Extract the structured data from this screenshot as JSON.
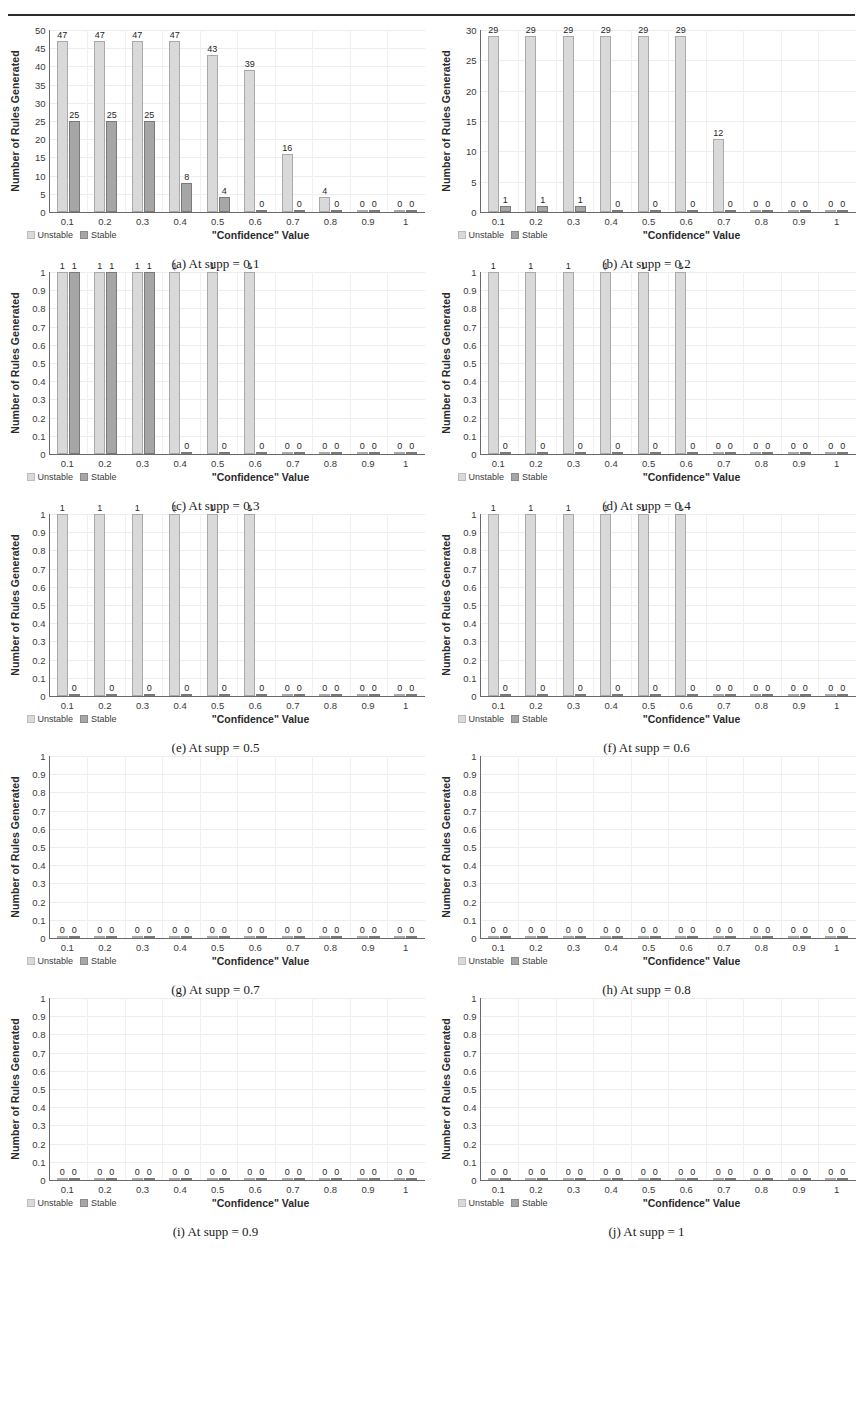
{
  "header": {
    "running_head": ""
  },
  "common": {
    "y_axis_title": "Number of Rules Generated",
    "x_axis_title": "\"Confidence\" Value",
    "legend": [
      {
        "label": "Unstable",
        "color": "#d9d9d9"
      },
      {
        "label": "Stable",
        "color": "#a6a6a6"
      }
    ],
    "categories": [
      "0.1",
      "0.2",
      "0.3",
      "0.4",
      "0.5",
      "0.6",
      "0.7",
      "0.8",
      "0.9",
      "1"
    ],
    "yticks_small": [
      "1",
      "0.9",
      "0.8",
      "0.7",
      "0.6",
      "0.5",
      "0.4",
      "0.3",
      "0.2",
      "0.1",
      "0"
    ],
    "yticks_a": [
      "50",
      "45",
      "40",
      "35",
      "30",
      "25",
      "20",
      "15",
      "10",
      "5",
      "0"
    ],
    "yticks_b": [
      "30",
      "25",
      "20",
      "15",
      "10",
      "5",
      "0"
    ]
  },
  "chart_data": [
    {
      "id": "a",
      "type": "bar",
      "caption": "(a) At supp = 0.1",
      "title": "",
      "xlabel": "\"Confidence\" Value",
      "ylabel": "Number of Rules Generated",
      "ylim": [
        0,
        50
      ],
      "ytick_step": 5,
      "grid": true,
      "legend_position": "bottom-left",
      "categories": [
        "0.1",
        "0.2",
        "0.3",
        "0.4",
        "0.5",
        "0.6",
        "0.7",
        "0.8",
        "0.9",
        "1"
      ],
      "series": [
        {
          "name": "Unstable",
          "values": [
            47,
            47,
            47,
            47,
            43,
            39,
            16,
            4,
            0,
            0
          ]
        },
        {
          "name": "Stable",
          "values": [
            25,
            25,
            25,
            8,
            4,
            0,
            0,
            0,
            0,
            0
          ]
        }
      ],
      "labels": [
        {
          "unstable": "47",
          "stable": "25"
        },
        {
          "unstable": "47",
          "stable": "25"
        },
        {
          "unstable": "47",
          "stable": "25"
        },
        {
          "unstable": "47",
          "stable": "8"
        },
        {
          "unstable": "43",
          "stable": "4"
        },
        {
          "unstable": "39",
          "stable": "0"
        },
        {
          "unstable": "16",
          "stable": "0"
        },
        {
          "unstable": "4",
          "stable": "0"
        },
        {
          "unstable": "0",
          "stable": "0"
        },
        {
          "unstable": "0",
          "stable": "0"
        }
      ]
    },
    {
      "id": "b",
      "type": "bar",
      "caption": "(b) At supp = 0.2",
      "title": "",
      "xlabel": "\"Confidence\" Value",
      "ylabel": "Number of Rules Generated",
      "ylim": [
        0,
        30
      ],
      "ytick_step": 5,
      "grid": true,
      "legend_position": "bottom-left",
      "categories": [
        "0.1",
        "0.2",
        "0.3",
        "0.4",
        "0.5",
        "0.6",
        "0.7",
        "0.8",
        "0.9",
        "1"
      ],
      "series": [
        {
          "name": "Unstable",
          "values": [
            29,
            29,
            29,
            29,
            29,
            29,
            12,
            0,
            0,
            0
          ]
        },
        {
          "name": "Stable",
          "values": [
            1,
            1,
            1,
            0,
            0,
            0,
            0,
            0,
            0,
            0
          ]
        }
      ],
      "labels": [
        {
          "unstable": "29",
          "stable": "1"
        },
        {
          "unstable": "29",
          "stable": "1"
        },
        {
          "unstable": "29",
          "stable": "1"
        },
        {
          "unstable": "29",
          "stable": "0"
        },
        {
          "unstable": "29",
          "stable": "0"
        },
        {
          "unstable": "29",
          "stable": "0"
        },
        {
          "unstable": "12",
          "stable": "0"
        },
        {
          "unstable": "0",
          "stable": "0"
        },
        {
          "unstable": "0",
          "stable": "0"
        },
        {
          "unstable": "0",
          "stable": "0"
        }
      ]
    },
    {
      "id": "c",
      "type": "bar",
      "caption": "(c) At supp = 0.3",
      "title": "",
      "xlabel": "\"Confidence\" Value",
      "ylabel": "Number of Rules Generated",
      "ylim": [
        0,
        1
      ],
      "ytick_step": 0.1,
      "grid": true,
      "legend_position": "bottom-left",
      "categories": [
        "0.1",
        "0.2",
        "0.3",
        "0.4",
        "0.5",
        "0.6",
        "0.7",
        "0.8",
        "0.9",
        "1"
      ],
      "series": [
        {
          "name": "Unstable",
          "values": [
            1,
            1,
            1,
            1,
            1,
            1,
            0,
            0,
            0,
            0
          ]
        },
        {
          "name": "Stable",
          "values": [
            1,
            1,
            1,
            0,
            0,
            0,
            0,
            0,
            0,
            0
          ]
        }
      ],
      "labels": [
        {
          "unstable": "1",
          "stable": "1"
        },
        {
          "unstable": "1",
          "stable": "1"
        },
        {
          "unstable": "1",
          "stable": "1"
        },
        {
          "unstable": "1",
          "stable": "0"
        },
        {
          "unstable": "1",
          "stable": "0"
        },
        {
          "unstable": "1",
          "stable": "0"
        },
        {
          "unstable": "0",
          "stable": "0"
        },
        {
          "unstable": "0",
          "stable": "0"
        },
        {
          "unstable": "0",
          "stable": "0"
        },
        {
          "unstable": "0",
          "stable": "0"
        }
      ]
    },
    {
      "id": "d",
      "type": "bar",
      "caption": "(d) At supp = 0.4",
      "title": "",
      "xlabel": "\"Confidence\" Value",
      "ylabel": "Number of Rules Generated",
      "ylim": [
        0,
        1
      ],
      "ytick_step": 0.1,
      "grid": true,
      "legend_position": "bottom-left",
      "categories": [
        "0.1",
        "0.2",
        "0.3",
        "0.4",
        "0.5",
        "0.6",
        "0.7",
        "0.8",
        "0.9",
        "1"
      ],
      "series": [
        {
          "name": "Unstable",
          "values": [
            1,
            1,
            1,
            1,
            1,
            1,
            0,
            0,
            0,
            0
          ]
        },
        {
          "name": "Stable",
          "values": [
            0,
            0,
            0,
            0,
            0,
            0,
            0,
            0,
            0,
            0
          ]
        }
      ],
      "labels": [
        {
          "unstable": "1",
          "stable": "0"
        },
        {
          "unstable": "1",
          "stable": "0"
        },
        {
          "unstable": "1",
          "stable": "0"
        },
        {
          "unstable": "1",
          "stable": "0"
        },
        {
          "unstable": "1",
          "stable": "0"
        },
        {
          "unstable": "1",
          "stable": "0"
        },
        {
          "unstable": "0",
          "stable": "0"
        },
        {
          "unstable": "0",
          "stable": "0"
        },
        {
          "unstable": "0",
          "stable": "0"
        },
        {
          "unstable": "0",
          "stable": "0"
        }
      ]
    },
    {
      "id": "e",
      "type": "bar",
      "caption": "(e) At supp = 0.5",
      "title": "",
      "xlabel": "\"Confidence\" Value",
      "ylabel": "Number of Rules Generated",
      "ylim": [
        0,
        1
      ],
      "ytick_step": 0.1,
      "grid": true,
      "legend_position": "bottom-left",
      "categories": [
        "0.1",
        "0.2",
        "0.3",
        "0.4",
        "0.5",
        "0.6",
        "0.7",
        "0.8",
        "0.9",
        "1"
      ],
      "series": [
        {
          "name": "Unstable",
          "values": [
            1,
            1,
            1,
            1,
            1,
            1,
            0,
            0,
            0,
            0
          ]
        },
        {
          "name": "Stable",
          "values": [
            0,
            0,
            0,
            0,
            0,
            0,
            0,
            0,
            0,
            0
          ]
        }
      ],
      "labels": [
        {
          "unstable": "1",
          "stable": "0"
        },
        {
          "unstable": "1",
          "stable": "0"
        },
        {
          "unstable": "1",
          "stable": "0"
        },
        {
          "unstable": "1",
          "stable": "0"
        },
        {
          "unstable": "1",
          "stable": "0"
        },
        {
          "unstable": "1",
          "stable": "0"
        },
        {
          "unstable": "0",
          "stable": "0"
        },
        {
          "unstable": "0",
          "stable": "0"
        },
        {
          "unstable": "0",
          "stable": "0"
        },
        {
          "unstable": "0",
          "stable": "0"
        }
      ]
    },
    {
      "id": "f",
      "type": "bar",
      "caption": "(f) At supp = 0.6",
      "title": "",
      "xlabel": "\"Confidence\" Value",
      "ylabel": "Number of Rules Generated",
      "ylim": [
        0,
        1
      ],
      "ytick_step": 0.1,
      "grid": true,
      "legend_position": "bottom-left",
      "categories": [
        "0.1",
        "0.2",
        "0.3",
        "0.4",
        "0.5",
        "0.6",
        "0.7",
        "0.8",
        "0.9",
        "1"
      ],
      "series": [
        {
          "name": "Unstable",
          "values": [
            1,
            1,
            1,
            1,
            1,
            1,
            0,
            0,
            0,
            0
          ]
        },
        {
          "name": "Stable",
          "values": [
            0,
            0,
            0,
            0,
            0,
            0,
            0,
            0,
            0,
            0
          ]
        }
      ],
      "labels": [
        {
          "unstable": "1",
          "stable": "0"
        },
        {
          "unstable": "1",
          "stable": "0"
        },
        {
          "unstable": "1",
          "stable": "0"
        },
        {
          "unstable": "1",
          "stable": "0"
        },
        {
          "unstable": "1",
          "stable": "0"
        },
        {
          "unstable": "1",
          "stable": "0"
        },
        {
          "unstable": "0",
          "stable": "0"
        },
        {
          "unstable": "0",
          "stable": "0"
        },
        {
          "unstable": "0",
          "stable": "0"
        },
        {
          "unstable": "0",
          "stable": "0"
        }
      ]
    },
    {
      "id": "g",
      "type": "bar",
      "caption": "(g) At supp = 0.7",
      "title": "",
      "xlabel": "\"Confidence\" Value",
      "ylabel": "Number of Rules Generated",
      "ylim": [
        0,
        1
      ],
      "ytick_step": 0.1,
      "grid": true,
      "legend_position": "bottom-left",
      "categories": [
        "0.1",
        "0.2",
        "0.3",
        "0.4",
        "0.5",
        "0.6",
        "0.7",
        "0.8",
        "0.9",
        "1"
      ],
      "series": [
        {
          "name": "Unstable",
          "values": [
            0,
            0,
            0,
            0,
            0,
            0,
            0,
            0,
            0,
            0
          ]
        },
        {
          "name": "Stable",
          "values": [
            0,
            0,
            0,
            0,
            0,
            0,
            0,
            0,
            0,
            0
          ]
        }
      ],
      "labels": [
        {
          "unstable": "0",
          "stable": "0"
        },
        {
          "unstable": "0",
          "stable": "0"
        },
        {
          "unstable": "0",
          "stable": "0"
        },
        {
          "unstable": "0",
          "stable": "0"
        },
        {
          "unstable": "0",
          "stable": "0"
        },
        {
          "unstable": "0",
          "stable": "0"
        },
        {
          "unstable": "0",
          "stable": "0"
        },
        {
          "unstable": "0",
          "stable": "0"
        },
        {
          "unstable": "0",
          "stable": "0"
        },
        {
          "unstable": "0",
          "stable": "0"
        }
      ]
    },
    {
      "id": "h",
      "type": "bar",
      "caption": "(h) At supp = 0.8",
      "title": "",
      "xlabel": "\"Confidence\" Value",
      "ylabel": "Number of Rules Generated",
      "ylim": [
        0,
        1
      ],
      "ytick_step": 0.1,
      "grid": true,
      "legend_position": "bottom-left",
      "categories": [
        "0.1",
        "0.2",
        "0.3",
        "0.4",
        "0.5",
        "0.6",
        "0.7",
        "0.8",
        "0.9",
        "1"
      ],
      "series": [
        {
          "name": "Unstable",
          "values": [
            0,
            0,
            0,
            0,
            0,
            0,
            0,
            0,
            0,
            0
          ]
        },
        {
          "name": "Stable",
          "values": [
            0,
            0,
            0,
            0,
            0,
            0,
            0,
            0,
            0,
            0
          ]
        }
      ],
      "labels": [
        {
          "unstable": "0",
          "stable": "0"
        },
        {
          "unstable": "0",
          "stable": "0"
        },
        {
          "unstable": "0",
          "stable": "0"
        },
        {
          "unstable": "0",
          "stable": "0"
        },
        {
          "unstable": "0",
          "stable": "0"
        },
        {
          "unstable": "0",
          "stable": "0"
        },
        {
          "unstable": "0",
          "stable": "0"
        },
        {
          "unstable": "0",
          "stable": "0"
        },
        {
          "unstable": "0",
          "stable": "0"
        },
        {
          "unstable": "0",
          "stable": "0"
        }
      ]
    },
    {
      "id": "i",
      "type": "bar",
      "caption": "(i) At supp = 0.9",
      "title": "",
      "xlabel": "\"Confidence\" Value",
      "ylabel": "Number of Rules Generated",
      "ylim": [
        0,
        1
      ],
      "ytick_step": 0.1,
      "grid": true,
      "legend_position": "bottom-left",
      "categories": [
        "0.1",
        "0.2",
        "0.3",
        "0.4",
        "0.5",
        "0.6",
        "0.7",
        "0.8",
        "0.9",
        "1"
      ],
      "series": [
        {
          "name": "Unstable",
          "values": [
            0,
            0,
            0,
            0,
            0,
            0,
            0,
            0,
            0,
            0
          ]
        },
        {
          "name": "Stable",
          "values": [
            0,
            0,
            0,
            0,
            0,
            0,
            0,
            0,
            0,
            0
          ]
        }
      ],
      "labels": [
        {
          "unstable": "0",
          "stable": "0"
        },
        {
          "unstable": "0",
          "stable": "0"
        },
        {
          "unstable": "0",
          "stable": "0"
        },
        {
          "unstable": "0",
          "stable": "0"
        },
        {
          "unstable": "0",
          "stable": "0"
        },
        {
          "unstable": "0",
          "stable": "0"
        },
        {
          "unstable": "0",
          "stable": "0"
        },
        {
          "unstable": "0",
          "stable": "0"
        },
        {
          "unstable": "0",
          "stable": "0"
        },
        {
          "unstable": "0",
          "stable": "0"
        }
      ]
    },
    {
      "id": "j",
      "type": "bar",
      "caption": "(j) At supp = 1",
      "title": "",
      "xlabel": "\"Confidence\" Value",
      "ylabel": "Number of Rules Generated",
      "ylim": [
        0,
        1
      ],
      "ytick_step": 0.1,
      "grid": true,
      "legend_position": "bottom-left",
      "categories": [
        "0.1",
        "0.2",
        "0.3",
        "0.4",
        "0.5",
        "0.6",
        "0.7",
        "0.8",
        "0.9",
        "1"
      ],
      "series": [
        {
          "name": "Unstable",
          "values": [
            0,
            0,
            0,
            0,
            0,
            0,
            0,
            0,
            0,
            0
          ]
        },
        {
          "name": "Stable",
          "values": [
            0,
            0,
            0,
            0,
            0,
            0,
            0,
            0,
            0,
            0
          ]
        }
      ],
      "labels": [
        {
          "unstable": "0",
          "stable": "0"
        },
        {
          "unstable": "0",
          "stable": "0"
        },
        {
          "unstable": "0",
          "stable": "0"
        },
        {
          "unstable": "0",
          "stable": "0"
        },
        {
          "unstable": "0",
          "stable": "0"
        },
        {
          "unstable": "0",
          "stable": "0"
        },
        {
          "unstable": "0",
          "stable": "0"
        },
        {
          "unstable": "0",
          "stable": "0"
        },
        {
          "unstable": "0",
          "stable": "0"
        },
        {
          "unstable": "0",
          "stable": "0"
        }
      ]
    }
  ]
}
